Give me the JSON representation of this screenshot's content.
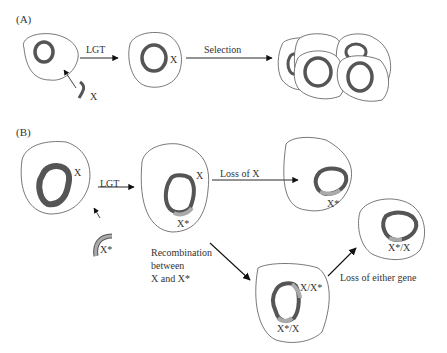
{
  "panels": {
    "a": {
      "label": "(A)",
      "gene_x": "X",
      "cell2_gene": "X",
      "step1": "LGT",
      "step2": "Selection"
    },
    "b": {
      "label": "(B)",
      "cell1_gene": "X",
      "donor_gene": "X*",
      "step1": "LGT",
      "cell2_gene_top": "X",
      "cell2_gene_bottom": "X*",
      "loss_x": "Loss of X",
      "cell3_gene": "X*",
      "recomb_line1": "Recombination",
      "recomb_line2": "between",
      "recomb_line3": "X and X*",
      "cell4_gene_top": "X/X*",
      "cell4_gene_bottom": "X*/X",
      "loss_either": "Loss of either gene",
      "cell5_gene": "X*/X"
    }
  },
  "colors": {
    "outline": "#555555",
    "chromosome": "#555555",
    "inserted_segment": "#a8a8a8",
    "arrow": "#111111"
  }
}
